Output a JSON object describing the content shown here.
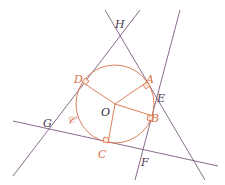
{
  "colors": {
    "line": "#7a5a7e",
    "circle": "#d8704a",
    "label_dark": "#4a3a4e",
    "label_orange": "#d8704a"
  },
  "circle": {
    "name": "𝒞",
    "center_label": "O",
    "cx": 115,
    "cy": 104,
    "r": 40
  },
  "points": {
    "A": {
      "label": "A",
      "x": 146,
      "y": 79
    },
    "B": {
      "label": "B",
      "x": 153,
      "y": 116
    },
    "C": {
      "label": "C",
      "x": 110,
      "y": 143
    },
    "D": {
      "label": "D",
      "x": 83,
      "y": 80
    },
    "E": {
      "label": "E",
      "x": 156,
      "y": 97
    },
    "F": {
      "label": "F",
      "x": 143,
      "y": 158
    },
    "G": {
      "label": "G",
      "x": 49,
      "y": 130
    },
    "H": {
      "label": "H",
      "x": 119,
      "y": 34
    }
  },
  "lines": [
    {
      "name": "tangent-D-line-GH",
      "x1": 13,
      "y1": 176,
      "x2": 140,
      "y2": 10
    },
    {
      "name": "tangent-A-line-HE",
      "x1": 105,
      "y1": 10,
      "x2": 205,
      "y2": 180
    },
    {
      "name": "tangent-B-line-EF",
      "x1": 180,
      "y1": 10,
      "x2": 135,
      "y2": 180
    },
    {
      "name": "tangent-C-line-GF",
      "x1": 13,
      "y1": 121,
      "x2": 218,
      "y2": 166
    }
  ],
  "radii": [
    "OA",
    "OB",
    "OC",
    "OD"
  ]
}
